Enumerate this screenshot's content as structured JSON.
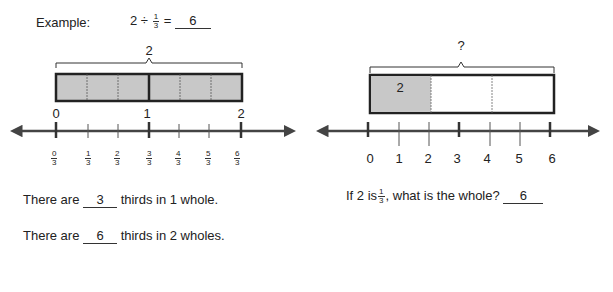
{
  "example": {
    "label": "Example:",
    "equation_whole": "2",
    "operator": "÷",
    "frac_num": "1",
    "frac_den": "3",
    "equals": "=",
    "answer": "6"
  },
  "left_diagram": {
    "brace_label": "2",
    "tape": {
      "parts": 6,
      "shaded_parts": 6,
      "fill": "#c8c8c8"
    },
    "whole_labels": [
      "0",
      "1",
      "2"
    ],
    "fraction_labels": [
      {
        "num": "0",
        "den": "3"
      },
      {
        "num": "1",
        "den": "3"
      },
      {
        "num": "2",
        "den": "3"
      },
      {
        "num": "3",
        "den": "3"
      },
      {
        "num": "4",
        "den": "3"
      },
      {
        "num": "5",
        "den": "3"
      },
      {
        "num": "6",
        "den": "3"
      }
    ]
  },
  "right_diagram": {
    "brace_label": "?",
    "tape": {
      "parts": 3,
      "shaded_parts": 1,
      "shaded_label": "2",
      "fill": "#c8c8c8"
    },
    "tick_labels": [
      "0",
      "1",
      "2",
      "3",
      "4",
      "5",
      "6"
    ]
  },
  "sentences": {
    "s1_prefix": "There are",
    "s1_answer": "3",
    "s1_suffix": "thirds in 1 whole.",
    "s2_prefix": "There are",
    "s2_answer": "6",
    "s2_suffix": "thirds in 2 wholes.",
    "s3_prefix": "If 2 is",
    "s3_frac_num": "1",
    "s3_frac_den": "3",
    "s3_suffix": ", what is the whole?",
    "s3_answer": "6"
  }
}
